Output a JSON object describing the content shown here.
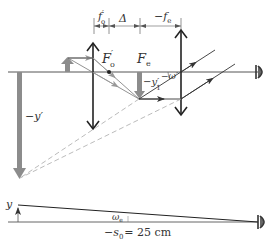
{
  "diagram": {
    "type": "optical-ray-diagram",
    "colors": {
      "line": "#333333",
      "gray_arrow": "#8c8c8c",
      "dashed": "#aaaaaa",
      "axis": "#555555"
    },
    "dimensions": {
      "fo_label": "f",
      "fo_sup": "′",
      "fo_sub": "o",
      "delta_label": "Δ",
      "fe_label": "−f",
      "fe_sub": "e"
    },
    "points": {
      "Fo_label": "F",
      "Fo_sup": "′",
      "Fo_sub": "o",
      "Fe_label": "F",
      "Fe_sub": "e"
    },
    "images": {
      "intermediate_label": "−y′",
      "intermediate_sub": "1",
      "final_label": "−y′"
    },
    "angles": {
      "eyepiece_angle": "−ω′",
      "naked_eye_angle": "ω",
      "naked_eye_sub": "e"
    },
    "bottom": {
      "object_label": "y",
      "distance_label_pre": "−s",
      "distance_sub": "0",
      "distance_label_post": "= 25 cm"
    },
    "icons": [
      "eye-icon-top",
      "eye-icon-bottom"
    ]
  }
}
